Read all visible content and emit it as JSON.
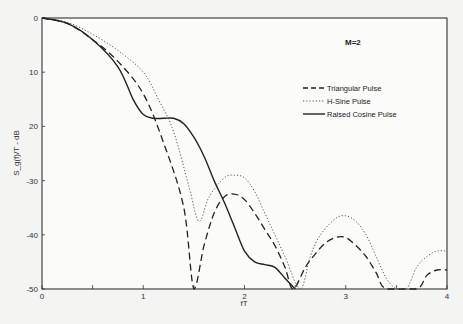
{
  "chart_data": {
    "type": "line",
    "title": "",
    "annotation": "M=2",
    "xlabel": "fT",
    "ylabel": "S_g(f)/T - dB",
    "xlim": [
      0,
      4
    ],
    "ylim": [
      -50,
      0
    ],
    "x_ticks": [
      "0",
      "1",
      "2",
      "3",
      "4"
    ],
    "y_ticks": [
      "0",
      "-10",
      "-20",
      "-30",
      "-40",
      "-50"
    ],
    "y_tick_labels_display": [
      "0",
      "10",
      "20",
      "-30",
      "-40",
      "-50"
    ],
    "grid": false,
    "legend_position": "upper right",
    "series": [
      {
        "name": "Triangular Pulse",
        "style": "dashed",
        "x": [
          0,
          0.25,
          0.5,
          0.75,
          1.0,
          1.2,
          1.4,
          1.5,
          1.6,
          1.7,
          1.8,
          1.9,
          2.0,
          2.1,
          2.2,
          2.3,
          2.4,
          2.48,
          2.6,
          2.7,
          2.8,
          2.9,
          3.0,
          3.1,
          3.2,
          3.3,
          3.4,
          3.7,
          3.8,
          3.9,
          4.0
        ],
        "values": [
          0,
          -1,
          -4,
          -8,
          -14,
          -23,
          -35,
          -50,
          -42,
          -36,
          -33,
          -32.5,
          -33.5,
          -36,
          -39,
          -42,
          -46,
          -50,
          -46,
          -43.5,
          -41.5,
          -40.5,
          -40.5,
          -42,
          -44,
          -47,
          -50,
          -50,
          -47.5,
          -46.5,
          -46.5
        ]
      },
      {
        "name": "H-Sine Pulse",
        "style": "dotted",
        "x": [
          0,
          0.25,
          0.5,
          0.75,
          1.0,
          1.15,
          1.3,
          1.45,
          1.55,
          1.65,
          1.8,
          1.9,
          2.0,
          2.1,
          2.2,
          2.3,
          2.4,
          2.55,
          2.65,
          2.75,
          2.9,
          3.0,
          3.1,
          3.2,
          3.3,
          3.4,
          3.5,
          3.6,
          3.7,
          3.8,
          3.9,
          4.0
        ],
        "values": [
          0,
          -0.8,
          -3,
          -6,
          -10,
          -15,
          -21,
          -31,
          -37.5,
          -33,
          -29.5,
          -29,
          -29.5,
          -32,
          -36,
          -40,
          -44,
          -50,
          -44,
          -40,
          -37,
          -36.5,
          -37.5,
          -40,
          -44,
          -48,
          -50,
          -50,
          -46,
          -44,
          -43,
          -43
        ]
      },
      {
        "name": "Raised Cosine Pulse",
        "style": "solid",
        "x": [
          0,
          0.25,
          0.5,
          0.75,
          0.9,
          1.0,
          1.1,
          1.2,
          1.3,
          1.4,
          1.5,
          1.6,
          1.7,
          1.8,
          1.9,
          2.0,
          2.1,
          2.2,
          2.3,
          2.4,
          2.5
        ],
        "values": [
          0,
          -1,
          -4,
          -9,
          -15,
          -17.8,
          -18.5,
          -18.5,
          -18.5,
          -19.5,
          -22,
          -25.5,
          -30,
          -34,
          -38.5,
          -43,
          -45,
          -45.5,
          -46,
          -48,
          -50
        ]
      }
    ]
  }
}
